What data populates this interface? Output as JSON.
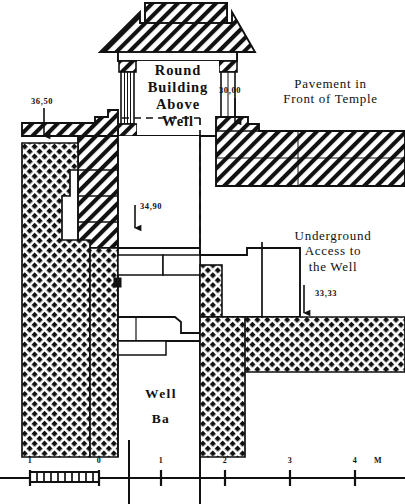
{
  "figure": {
    "kind": "archaeological-cross-section",
    "ink_color": "#111111",
    "paper_color": "#ffffff"
  },
  "labels": {
    "round_building": "Round\nBuilding\nAbove\nWell",
    "pavement": "Pavement in\nFront of Temple",
    "underground_access": "Underground\nAccess to\nthe Well",
    "well_name_line1": "Well",
    "well_name_line2": "Ba"
  },
  "elevations": [
    {
      "id": "elev-36-50",
      "value": "36,50"
    },
    {
      "id": "elev-30-00",
      "value": "30,00"
    },
    {
      "id": "elev-34-90",
      "value": "34,90"
    },
    {
      "id": "elev-33-33",
      "value": "33,33"
    }
  ],
  "scale_bar": {
    "unit_label": "M",
    "ticks": [
      "1",
      "0",
      "1",
      "2",
      "3",
      "4"
    ]
  }
}
